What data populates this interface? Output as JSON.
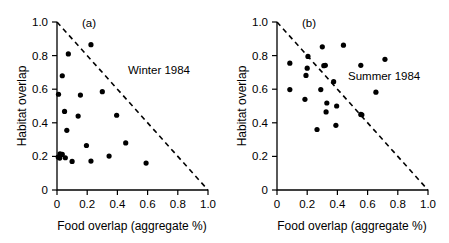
{
  "figure": {
    "background": "#ffffff",
    "marker_color": "#000000",
    "axis_color": "#000000"
  },
  "chart_data": [
    {
      "type": "scatter",
      "panel_tag": "(a)",
      "title": "Winter 1984",
      "xlabel": "Food overlap (aggregate %)",
      "ylabel": "Habitat overlap",
      "xlim": [
        0,
        1.0
      ],
      "ylim": [
        0,
        1.0
      ],
      "xticks": [
        "0",
        "0.2",
        "0.4",
        "0.6",
        "0.8",
        "1.0"
      ],
      "yticks": [
        "0",
        "0.2",
        "0.4",
        "0.6",
        "0.8",
        "1.0"
      ],
      "xtick_values": [
        0,
        0.2,
        0.4,
        0.6,
        0.8,
        1.0
      ],
      "ytick_values": [
        0,
        0.2,
        0.4,
        0.6,
        0.8,
        1.0
      ],
      "grid": false,
      "legend_position": "inside-upper-right",
      "annotation": "Winter 1984",
      "constraint_line": {
        "style": "dashed",
        "x": [
          0.0,
          1.0
        ],
        "y": [
          1.0,
          0.0
        ],
        "description": "x + y = 1 boundary"
      },
      "points": [
        {
          "x": 0.225,
          "y": 0.865
        },
        {
          "x": 0.075,
          "y": 0.81
        },
        {
          "x": 0.035,
          "y": 0.68
        },
        {
          "x": 0.01,
          "y": 0.57
        },
        {
          "x": 0.155,
          "y": 0.565
        },
        {
          "x": 0.3,
          "y": 0.585
        },
        {
          "x": 0.05,
          "y": 0.468
        },
        {
          "x": 0.14,
          "y": 0.44
        },
        {
          "x": 0.395,
          "y": 0.445
        },
        {
          "x": 0.065,
          "y": 0.355
        },
        {
          "x": 0.195,
          "y": 0.265
        },
        {
          "x": 0.455,
          "y": 0.28
        },
        {
          "x": 0.02,
          "y": 0.215
        },
        {
          "x": 0.035,
          "y": 0.212
        },
        {
          "x": 0.008,
          "y": 0.196
        },
        {
          "x": 0.018,
          "y": 0.19
        },
        {
          "x": 0.055,
          "y": 0.192
        },
        {
          "x": 0.1,
          "y": 0.17
        },
        {
          "x": 0.225,
          "y": 0.172
        },
        {
          "x": 0.345,
          "y": 0.202
        },
        {
          "x": 0.59,
          "y": 0.16
        }
      ]
    },
    {
      "type": "scatter",
      "panel_tag": "(b)",
      "title": "Summer 1984",
      "xlabel": "Food overlap (aggregate %)",
      "ylabel": "Habitat overlap",
      "xlim": [
        0,
        1.0
      ],
      "ylim": [
        0,
        1.0
      ],
      "xticks": [
        "0",
        "0.2",
        "0.4",
        "0.6",
        "0.8",
        "1.0"
      ],
      "yticks": [
        "0",
        "0.2",
        "0.4",
        "0.6",
        "0.8",
        "1.0"
      ],
      "xtick_values": [
        0,
        0.2,
        0.4,
        0.6,
        0.8,
        1.0
      ],
      "ytick_values": [
        0,
        0.2,
        0.4,
        0.6,
        0.8,
        1.0
      ],
      "grid": false,
      "legend_position": "inside-upper-right",
      "annotation": "Summer 1984",
      "constraint_line": {
        "style": "dashed",
        "x": [
          0.0,
          1.0
        ],
        "y": [
          1.0,
          0.0
        ],
        "description": "x + y = 1 boundary"
      },
      "points": [
        {
          "x": 0.44,
          "y": 0.862
        },
        {
          "x": 0.3,
          "y": 0.852
        },
        {
          "x": 0.205,
          "y": 0.795
        },
        {
          "x": 0.715,
          "y": 0.778
        },
        {
          "x": 0.085,
          "y": 0.755
        },
        {
          "x": 0.31,
          "y": 0.74
        },
        {
          "x": 0.32,
          "y": 0.742
        },
        {
          "x": 0.555,
          "y": 0.742
        },
        {
          "x": 0.2,
          "y": 0.725
        },
        {
          "x": 0.192,
          "y": 0.682
        },
        {
          "x": 0.375,
          "y": 0.645
        },
        {
          "x": 0.085,
          "y": 0.598
        },
        {
          "x": 0.29,
          "y": 0.598
        },
        {
          "x": 0.655,
          "y": 0.582
        },
        {
          "x": 0.185,
          "y": 0.54
        },
        {
          "x": 0.33,
          "y": 0.518
        },
        {
          "x": 0.395,
          "y": 0.5
        },
        {
          "x": 0.325,
          "y": 0.465
        },
        {
          "x": 0.555,
          "y": 0.45
        },
        {
          "x": 0.562,
          "y": 0.448
        },
        {
          "x": 0.39,
          "y": 0.385
        },
        {
          "x": 0.265,
          "y": 0.36
        }
      ]
    }
  ]
}
